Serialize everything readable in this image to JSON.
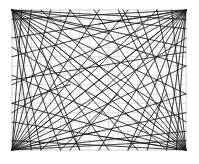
{
  "diagram": {
    "type": "string-art",
    "grid": {
      "columns": 18,
      "rows": 15,
      "line_color": "#c8c8c8"
    },
    "line_color": "#1a1a1a",
    "background": "#ffffff",
    "corners": [
      {
        "name": "top-left",
        "origin": [
          0,
          0
        ],
        "targets": [
          [
            18,
            1
          ],
          [
            18,
            2
          ],
          [
            18,
            4
          ],
          [
            18,
            6
          ],
          [
            18,
            9
          ],
          [
            18,
            12
          ],
          [
            18,
            15
          ],
          [
            16,
            15
          ],
          [
            13,
            15
          ],
          [
            10,
            15
          ],
          [
            7,
            15
          ],
          [
            5,
            15
          ],
          [
            3,
            15
          ],
          [
            2,
            15
          ],
          [
            10,
            2.5
          ]
        ]
      },
      {
        "name": "top-right",
        "origin": [
          18,
          0
        ],
        "targets": [
          [
            0,
            1
          ],
          [
            0,
            3
          ],
          [
            0,
            5
          ],
          [
            0,
            8
          ],
          [
            0,
            11
          ],
          [
            0,
            15
          ],
          [
            3,
            15
          ],
          [
            6,
            15
          ],
          [
            9,
            15
          ],
          [
            12,
            15
          ],
          [
            14,
            15
          ],
          [
            16,
            15
          ],
          [
            17,
            15
          ],
          [
            9,
            1.5
          ]
        ]
      },
      {
        "name": "bottom-left",
        "origin": [
          0,
          15
        ],
        "targets": [
          [
            18,
            14
          ],
          [
            18,
            13
          ],
          [
            18,
            11
          ],
          [
            18,
            9
          ],
          [
            18,
            6
          ],
          [
            18,
            3
          ],
          [
            18,
            0
          ],
          [
            15,
            0
          ],
          [
            12,
            0
          ],
          [
            9,
            0
          ],
          [
            6,
            0
          ],
          [
            4,
            0
          ],
          [
            2,
            0
          ],
          [
            1,
            0
          ],
          [
            9,
            13
          ]
        ]
      },
      {
        "name": "bottom-right",
        "origin": [
          18,
          15
        ],
        "targets": [
          [
            0,
            14
          ],
          [
            0,
            12
          ],
          [
            0,
            10
          ],
          [
            0,
            7
          ],
          [
            0,
            4
          ],
          [
            0,
            0
          ],
          [
            3,
            0
          ],
          [
            6,
            0
          ],
          [
            8.5,
            0
          ],
          [
            11,
            0
          ],
          [
            13,
            0
          ],
          [
            15,
            0
          ],
          [
            16.5,
            0
          ],
          [
            9,
            13.5
          ]
        ]
      }
    ],
    "free_lines": [
      [
        [
          0,
          7.5
        ],
        [
          18,
          4.5
        ]
      ],
      [
        [
          3,
          4
        ],
        [
          7,
          15
        ]
      ],
      [
        [
          11.5,
          0
        ],
        [
          14,
          5
        ]
      ],
      [
        [
          5,
          15
        ],
        [
          11,
          9
        ]
      ],
      [
        [
          0,
          10
        ],
        [
          6,
          8
        ]
      ],
      [
        [
          12,
          15
        ],
        [
          16,
          9
        ]
      ]
    ]
  }
}
